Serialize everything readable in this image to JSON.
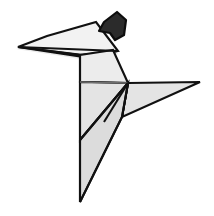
{
  "figure": {
    "canvas": {
      "width": 214,
      "height": 216,
      "background": "#ffffff"
    },
    "palette": {
      "paper_light": "#f2f2f2",
      "paper_mid": "#e4e4e4",
      "paper_shade": "#dcdcdc",
      "outline": "#111111",
      "soft_crease": "#6f6f6f",
      "head_fill": "#2b2b2b",
      "background": "#ffffff"
    },
    "parts": [
      {
        "name": "left-wing",
        "label": "Left wing",
        "fill": "#f2f2f2",
        "points": "18,47 47,36 96,22 118,51 83,55"
      },
      {
        "name": "left-wing-under",
        "label": "Left wing underside",
        "fill": "#e8e8e8",
        "points": "18,47 83,55 118,51 80,57"
      },
      {
        "name": "neck-panel",
        "label": "Neck panel",
        "fill": "#ececec",
        "points": "80,55 113,50 128,83 80,82"
      },
      {
        "name": "breast-panel",
        "label": "Breast panel",
        "fill": "#e4e4e4",
        "points": "80,82 128,83 80,140"
      },
      {
        "name": "right-wing-upper",
        "label": "Right wing upper",
        "fill": "#e4e4e4",
        "points": "128,83 200,82 122,117"
      },
      {
        "name": "right-wing-lower",
        "label": "Right wing lower",
        "fill": "#dcdcdc",
        "points": "128,83 122,117 104,122"
      },
      {
        "name": "tail-panel",
        "label": "Tail panel",
        "fill": "#dcdcdc",
        "points": "80,140 128,83 122,117 80,202"
      },
      {
        "name": "head",
        "label": "Head",
        "fill": "#2b2b2b",
        "points": "104,22 117,12 126,20 124,35 115,40 110,33 99,31"
      }
    ],
    "creases": [
      {
        "name": "spine-crease",
        "path": "M80,55 L80,202"
      },
      {
        "name": "wing-base-crease",
        "path": "M80,82 L128,83",
        "soft": true
      },
      {
        "name": "breast-fold",
        "path": "M128,83 L80,140"
      },
      {
        "name": "tail-fold",
        "path": "M128,83 L122,117"
      },
      {
        "name": "wing-split",
        "path": "M128,83 L104,122"
      },
      {
        "name": "lower-tail-fold",
        "path": "M122,117 L80,202"
      },
      {
        "name": "wing-tip-fold",
        "path": "M18,47 L118,51"
      }
    ]
  }
}
